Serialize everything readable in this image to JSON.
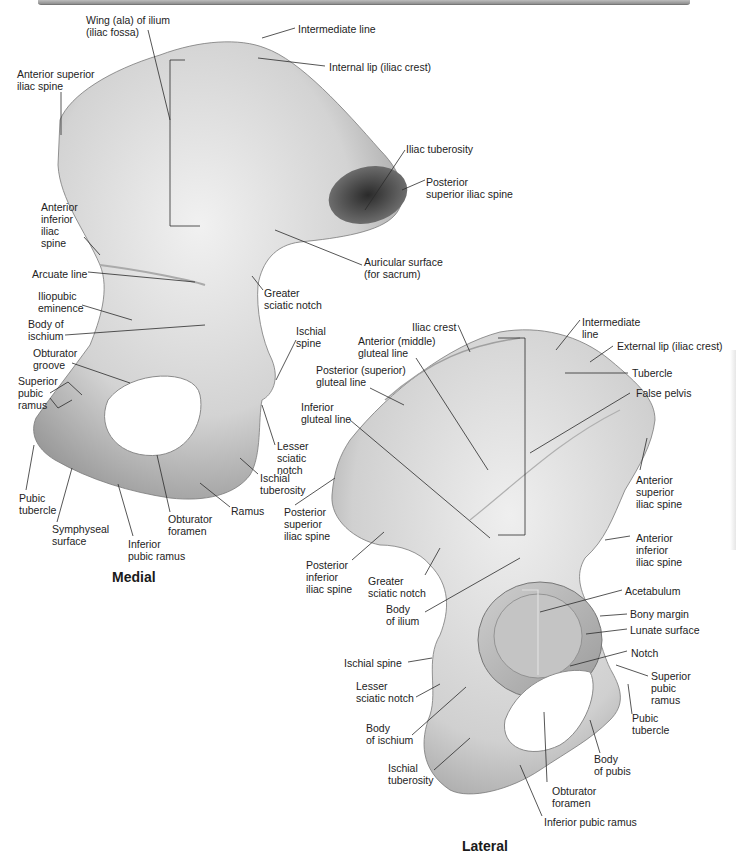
{
  "figure": {
    "views": [
      {
        "title": "Medial",
        "labels": [
          {
            "id": "m1",
            "text": "Wing (ala) of ilium\n(iliac fossa)",
            "x": 86,
            "y": 14
          },
          {
            "id": "m2",
            "text": "Intermediate line",
            "x": 298,
            "y": 23
          },
          {
            "id": "m3",
            "text": "Internal lip (iliac crest)",
            "x": 329,
            "y": 61
          },
          {
            "id": "m4",
            "text": "Anterior superior\niliac spine",
            "x": 17,
            "y": 68
          },
          {
            "id": "m5",
            "text": "Iliac tuberosity",
            "x": 406,
            "y": 143
          },
          {
            "id": "m6",
            "text": "Posterior\nsuperior iliac spine",
            "x": 426,
            "y": 176
          },
          {
            "id": "m7",
            "text": "Anterior\ninferior\niliac\nspine",
            "x": 41,
            "y": 201
          },
          {
            "id": "m8",
            "text": "Auricular surface\n(for sacrum)",
            "x": 364,
            "y": 256
          },
          {
            "id": "m9",
            "text": "Arcuate line",
            "x": 32,
            "y": 268
          },
          {
            "id": "m10",
            "text": "Greater\nsciatic notch",
            "x": 264,
            "y": 287
          },
          {
            "id": "m11",
            "text": "Iliopubic\neminence",
            "x": 38,
            "y": 290
          },
          {
            "id": "m12",
            "text": "Body of\nischium",
            "x": 28,
            "y": 318
          },
          {
            "id": "m13",
            "text": "Ischial\nspine",
            "x": 296,
            "y": 325
          },
          {
            "id": "m14",
            "text": "Obturator\ngroove",
            "x": 33,
            "y": 347
          },
          {
            "id": "m15",
            "text": "Superior\npubic\nramus",
            "x": 18,
            "y": 375
          },
          {
            "id": "m16",
            "text": "Lesser\nsciatic\nnotch",
            "x": 277,
            "y": 440
          },
          {
            "id": "m17",
            "text": "Ischial\ntuberosity",
            "x": 260,
            "y": 472
          },
          {
            "id": "m18",
            "text": "Pubic\ntubercle",
            "x": 19,
            "y": 492
          },
          {
            "id": "m19",
            "text": "Ramus",
            "x": 231,
            "y": 505
          },
          {
            "id": "m20",
            "text": "Obturator\nforamen",
            "x": 168,
            "y": 513
          },
          {
            "id": "m21",
            "text": "Symphyseal\nsurface",
            "x": 52,
            "y": 523
          },
          {
            "id": "m22",
            "text": "Inferior\npubic ramus",
            "x": 128,
            "y": 538
          }
        ]
      },
      {
        "title": "Lateral",
        "labels": [
          {
            "id": "l1",
            "text": "Iliac crest",
            "x": 412,
            "y": 321
          },
          {
            "id": "l2",
            "text": "Intermediate\nline",
            "x": 582,
            "y": 316
          },
          {
            "id": "l3",
            "text": "Anterior (middle)\ngluteal line",
            "x": 358,
            "y": 335
          },
          {
            "id": "l4",
            "text": "External lip (iliac crest)",
            "x": 617,
            "y": 340
          },
          {
            "id": "l5",
            "text": "Posterior (superior)\ngluteal line",
            "x": 316,
            "y": 364
          },
          {
            "id": "l6",
            "text": "Tubercle",
            "x": 632,
            "y": 367
          },
          {
            "id": "l7",
            "text": "False pelvis",
            "x": 636,
            "y": 387
          },
          {
            "id": "l8",
            "text": "Inferior\ngluteal line",
            "x": 301,
            "y": 401
          },
          {
            "id": "l9",
            "text": "Anterior\nsuperior\niliac spine",
            "x": 636,
            "y": 474
          },
          {
            "id": "l10",
            "text": "Posterior\nsuperior\niliac spine",
            "x": 284,
            "y": 506
          },
          {
            "id": "l11",
            "text": "Anterior\ninferior\niliac spine",
            "x": 636,
            "y": 532
          },
          {
            "id": "l12",
            "text": "Posterior\ninferior\niliac spine",
            "x": 306,
            "y": 559
          },
          {
            "id": "l13",
            "text": "Greater\nsciatic notch",
            "x": 368,
            "y": 575
          },
          {
            "id": "l14",
            "text": "Acetabulum",
            "x": 625,
            "y": 585
          },
          {
            "id": "l15",
            "text": "Body\nof ilium",
            "x": 386,
            "y": 603
          },
          {
            "id": "l16",
            "text": "Bony margin",
            "x": 630,
            "y": 608
          },
          {
            "id": "l17",
            "text": "Lunate surface",
            "x": 630,
            "y": 624
          },
          {
            "id": "l18",
            "text": "Notch",
            "x": 631,
            "y": 647
          },
          {
            "id": "l19",
            "text": "Ischial spine",
            "x": 344,
            "y": 657
          },
          {
            "id": "l20",
            "text": "Superior\npubic\nramus",
            "x": 651,
            "y": 670
          },
          {
            "id": "l21",
            "text": "Lesser\nsciatic notch",
            "x": 356,
            "y": 680
          },
          {
            "id": "l22",
            "text": "Pubic\ntubercle",
            "x": 632,
            "y": 712
          },
          {
            "id": "l23",
            "text": "Body\nof ischium",
            "x": 366,
            "y": 722
          },
          {
            "id": "l24",
            "text": "Ischial\ntuberosity",
            "x": 388,
            "y": 762
          },
          {
            "id": "l25",
            "text": "Body\nof pubis",
            "x": 594,
            "y": 753
          },
          {
            "id": "l26",
            "text": "Obturator\nforamen",
            "x": 552,
            "y": 785
          },
          {
            "id": "l27",
            "text": "Inferior pubic ramus",
            "x": 544,
            "y": 816
          }
        ]
      }
    ],
    "colors": {
      "bone_light": "#ececec",
      "bone_mid": "#bdbdbd",
      "bone_dark": "#3a3a3a",
      "leader_line": "#2b2b2b",
      "acetabulum_bracket": "#d8d8d8"
    }
  }
}
